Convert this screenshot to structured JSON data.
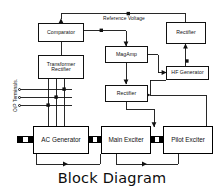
{
  "diagram": {
    "title": "Block Diagram",
    "background_color": "#ffffff",
    "line_color": "#111111",
    "nodes": [
      {
        "id": "comparator",
        "label_lines": [
          "Comparator"
        ]
      },
      {
        "id": "transformer_rectifier",
        "label_lines": [
          "Transformer",
          "Rectifier"
        ]
      },
      {
        "id": "magamp",
        "label_lines": [
          "MagAmp"
        ]
      },
      {
        "id": "rectifier_mid",
        "label_lines": [
          "Rectifier"
        ]
      },
      {
        "id": "rectifier_top_right",
        "label_lines": [
          "Rectifier"
        ]
      },
      {
        "id": "hf_generator",
        "label_lines": [
          "HF Generator"
        ]
      },
      {
        "id": "ac_generator",
        "label_lines": [
          "AC Generator"
        ]
      },
      {
        "id": "main_exciter",
        "label_lines": [
          "Main Exciter"
        ]
      },
      {
        "id": "pilot_exciter",
        "label_lines": [
          "Pilot Exciter"
        ]
      }
    ],
    "annotations": {
      "reference_voltage": "Reference Voltage",
      "output_terminals": "O/P Terminals."
    },
    "terminal_count": 3
  }
}
